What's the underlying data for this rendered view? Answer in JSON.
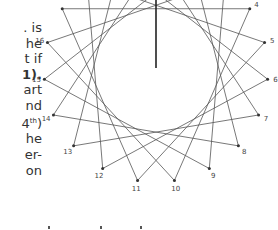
{
  "text_fragments": [
    {
      "text": ". is",
      "bold": false
    },
    {
      "text": "he",
      "bold": false
    },
    {
      "text": "t if",
      "bold": false
    },
    {
      "text": "1).",
      "bold": true
    },
    {
      "text": "art",
      "bold": false
    },
    {
      "text": "nd",
      "bold": false
    },
    {
      "text": "4",
      "sup": "th",
      "suffix": ")",
      "bold": false
    },
    {
      "text": "he",
      "bold": false
    },
    {
      "text": "er-",
      "bold": false
    },
    {
      "text": "on",
      "bold": false
    }
  ],
  "diagram": {
    "type": "star-polygon",
    "total_points": 19,
    "step": 6,
    "center": [
      156,
      70
    ],
    "radius": 112,
    "visible_labels": [
      "3",
      "4",
      "5",
      "6",
      "7",
      "8",
      "9",
      "10",
      "11",
      "12",
      "13",
      "14",
      "15",
      "16"
    ],
    "hand": {
      "from": [
        156,
        68
      ],
      "to": [
        156,
        -42
      ]
    },
    "colors": {
      "line": "#555555",
      "dot": "#333333",
      "hand": "#222222",
      "label": "#444444"
    }
  },
  "bottom_marks_x": [
    48,
    100,
    140
  ]
}
